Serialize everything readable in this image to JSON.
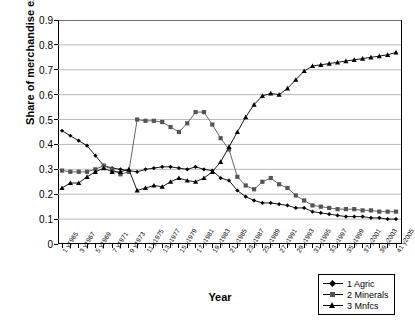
{
  "chart_data": {
    "type": "line",
    "title": "",
    "xlabel": "Year",
    "ylabel": "Share of merchandise exports",
    "ylim": [
      0,
      0.9
    ],
    "yticks": [
      "0",
      "0.1",
      "0.2",
      "0.3",
      "0.4",
      "0.5",
      "0.6",
      "0.7",
      "0.8",
      "0.9"
    ],
    "ytick_values": [
      0,
      0.1,
      0.2,
      0.3,
      0.4,
      0.5,
      0.6,
      0.7,
      0.8,
      0.9
    ],
    "grid": true,
    "legend_position": "bottom-right",
    "x": [
      1,
      2,
      3,
      4,
      5,
      6,
      7,
      8,
      9,
      10,
      11,
      12,
      13,
      14,
      15,
      16,
      17,
      18,
      19,
      20,
      21,
      22,
      23,
      24,
      25,
      26,
      27,
      28,
      29,
      30,
      31,
      32,
      33,
      34,
      35,
      36,
      37,
      38,
      39,
      40,
      41
    ],
    "categories": [
      "1 y1965",
      "2 y1966",
      "3 y1967",
      "4 y1968",
      "5 y1969",
      "6 y1970",
      "7 y1971",
      "8 y1972",
      "9 y1973",
      "10 y1974",
      "11 y1975",
      "12 y1976",
      "13 y1977",
      "14 y1978",
      "15 y1979",
      "16 y1980",
      "17 y1981",
      "18 y1982",
      "19 y1983",
      "20 y1984",
      "21 y1985",
      "22 y1986",
      "23 y1987",
      "24 y1988",
      "25 y1989",
      "26 y1990",
      "27 y1991",
      "28 y1992",
      "29 y1993",
      "30 y1994",
      "31 y1995",
      "32 y1996",
      "33 y1997",
      "34 y1998",
      "35 y1999",
      "36 y2000",
      "37 y2001",
      "38 y2002",
      "39 y2003",
      "40 y2004",
      "41 y2005"
    ],
    "tick_labels_shown": [
      "1 y1965",
      "3 y1967",
      "5 y1969",
      "7 y1971",
      "9 y1973",
      "11 y1975",
      "13 y1977",
      "15 y1979",
      "17 y1981",
      "19 y1983",
      "21 y1985",
      "23 y1987",
      "25 y1989",
      "27 y1991",
      "29 y1993",
      "31 y1995",
      "33 y1997",
      "35 y1999",
      "37 y2001",
      "39 y2003",
      "41 y2005"
    ],
    "series": [
      {
        "name": "1 Agric",
        "marker": "diamond",
        "color": "#000000",
        "values": [
          0.455,
          0.435,
          0.415,
          0.395,
          0.355,
          0.315,
          0.305,
          0.3,
          0.295,
          0.29,
          0.3,
          0.305,
          0.31,
          0.31,
          0.305,
          0.3,
          0.31,
          0.3,
          0.295,
          0.265,
          0.255,
          0.215,
          0.19,
          0.175,
          0.165,
          0.165,
          0.16,
          0.155,
          0.145,
          0.145,
          0.13,
          0.125,
          0.12,
          0.115,
          0.11,
          0.11,
          0.11,
          0.105,
          0.105,
          0.1,
          0.1
        ]
      },
      {
        "name": "2 Minerals",
        "marker": "square",
        "color": "#555555",
        "values": [
          0.295,
          0.29,
          0.29,
          0.29,
          0.3,
          0.315,
          0.3,
          0.28,
          0.29,
          0.5,
          0.495,
          0.495,
          0.49,
          0.47,
          0.45,
          0.485,
          0.53,
          0.53,
          0.48,
          0.425,
          0.38,
          0.27,
          0.235,
          0.22,
          0.25,
          0.265,
          0.24,
          0.225,
          0.195,
          0.175,
          0.155,
          0.15,
          0.145,
          0.14,
          0.14,
          0.14,
          0.135,
          0.135,
          0.13,
          0.13,
          0.13
        ]
      },
      {
        "name": "3 Mnfcs",
        "marker": "triangle",
        "color": "#000000",
        "values": [
          0.225,
          0.245,
          0.245,
          0.27,
          0.29,
          0.305,
          0.29,
          0.29,
          0.3,
          0.215,
          0.225,
          0.235,
          0.23,
          0.25,
          0.265,
          0.255,
          0.25,
          0.265,
          0.29,
          0.33,
          0.39,
          0.45,
          0.51,
          0.56,
          0.595,
          0.605,
          0.6,
          0.625,
          0.66,
          0.695,
          0.715,
          0.72,
          0.725,
          0.73,
          0.735,
          0.74,
          0.745,
          0.75,
          0.755,
          0.76,
          0.77
        ]
      }
    ]
  },
  "legend": {
    "items": [
      {
        "label": "1 Agric",
        "marker": "diamond"
      },
      {
        "label": "2 Minerals",
        "marker": "square"
      },
      {
        "label": "3 Mnfcs",
        "marker": "triangle"
      }
    ]
  }
}
